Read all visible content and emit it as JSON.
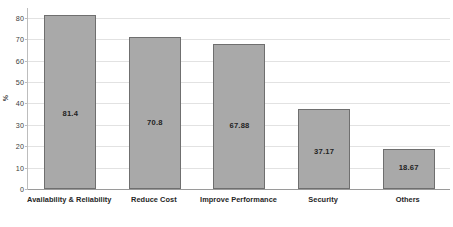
{
  "chart_data": {
    "type": "bar",
    "title": "",
    "subtitle": "",
    "xlabel": "",
    "ylabel": "%",
    "categories": [
      "Availability & Reliability",
      "Reduce Cost",
      "Improve Performance",
      "Security",
      "Others"
    ],
    "values": [
      81.4,
      70.8,
      67.88,
      37.17,
      18.67
    ],
    "value_labels": [
      "81.4",
      "70.8",
      "67.88",
      "37.17",
      "18.67"
    ],
    "ylim": [
      0,
      85
    ],
    "y_ticks": [
      0,
      10,
      20,
      30,
      40,
      50,
      60,
      70,
      80
    ],
    "y_tick_labels": [
      "0",
      "10",
      "20",
      "30",
      "40",
      "50",
      "60",
      "70",
      "80"
    ],
    "grid": true,
    "grid_axis": "y",
    "legend": false,
    "legend_position": "none",
    "series": [
      {
        "name": "%",
        "values": [
          81.4,
          70.8,
          67.88,
          37.17,
          18.67
        ]
      }
    ],
    "colors": {
      "bar_fill": "#a9a9a9",
      "bar_border": "#6f6f6f",
      "gridline": "#e2e2e2",
      "axis": "#9a9a9a",
      "text": "#262626",
      "background": "#ffffff"
    }
  },
  "caption": {
    "text": ""
  }
}
